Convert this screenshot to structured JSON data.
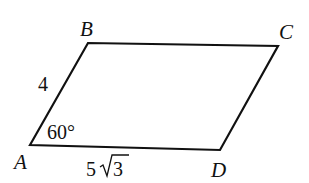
{
  "figure": {
    "type": "parallelogram",
    "vertices": {
      "A": {
        "label": "A",
        "x": 30,
        "y": 145
      },
      "B": {
        "label": "B",
        "x": 88,
        "y": 43
      },
      "C": {
        "label": "C",
        "x": 278,
        "y": 46
      },
      "D": {
        "label": "D",
        "x": 220,
        "y": 150
      }
    },
    "side_AB": {
      "label": "4"
    },
    "angle_A": {
      "label": "60°"
    },
    "side_AD": {
      "coefficient": "5",
      "radicand": "3",
      "label": "5√3"
    },
    "stroke_color": "#111111"
  }
}
